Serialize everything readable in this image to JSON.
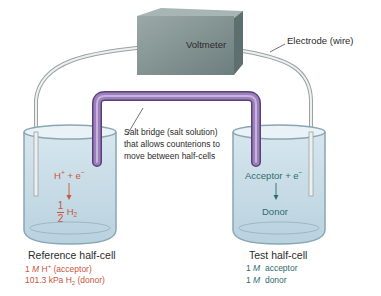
{
  "diagram": {
    "voltmeter": {
      "label": "Voltmeter"
    },
    "electrode": {
      "label": "Electrode (wire)"
    },
    "salt_bridge": {
      "line1": "Salt bridge (salt solution)",
      "line2": "that allows counterions to",
      "line3": "move between half-cells"
    },
    "reference_cell": {
      "title": "Reference half-cell",
      "reaction_top": "H",
      "reaction_top_sup": "+",
      "reaction_plus": " + e",
      "reaction_plus_sup": "−",
      "fraction_num": "1",
      "fraction_den": "2",
      "product": "H",
      "product_sub": "2",
      "line1_prefix": "1 ",
      "line1_unit": "M",
      "line1_species": " H",
      "line1_sup": "+",
      "line1_suffix": " (acceptor)",
      "line2_prefix": "101.3 kPa H",
      "line2_sub": "2",
      "line2_suffix": " (donor)"
    },
    "test_cell": {
      "title": "Test half-cell",
      "reaction_top": "Acceptor + e",
      "reaction_top_sup": "−",
      "product": "Donor",
      "line1_prefix": "1 ",
      "line1_unit": "M",
      "line1_suffix": "  acceptor",
      "line2_prefix": "1 ",
      "line2_unit": "M",
      "line2_suffix": "  donor"
    },
    "colors": {
      "solution": "#c9dde8",
      "beaker_edge": "#8aa5b3",
      "salt_bridge": "#8a6aa8",
      "voltmeter": "#7f9191",
      "wire": "#d8dcdc",
      "reference_text": "#c9553b",
      "test_text": "#2f6c6c"
    }
  }
}
